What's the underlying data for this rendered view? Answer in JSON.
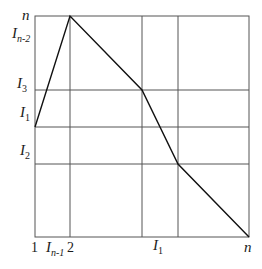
{
  "diagram": {
    "box": {
      "left": 35,
      "top": 16,
      "right": 249,
      "bottom": 237
    },
    "grid_color": "#555555",
    "line_color": "#111111",
    "vertical_lines_x": [
      70,
      142,
      178
    ],
    "horizontal_lines_y": [
      90,
      127,
      164
    ],
    "path_points": [
      [
        35,
        127
      ],
      [
        70,
        16
      ],
      [
        142,
        90
      ],
      [
        178,
        164
      ],
      [
        249,
        237
      ]
    ],
    "y_labels": [
      {
        "text": "n",
        "sub": "",
        "y": 16
      },
      {
        "text": "I",
        "sub": "n-2",
        "y": 33
      },
      {
        "text": "I",
        "sub": "3",
        "y": 84
      },
      {
        "text": "I",
        "sub": "1",
        "y": 113
      },
      {
        "text": "I",
        "sub": "2",
        "y": 151
      }
    ],
    "x_labels": [
      {
        "text": "1",
        "sub": "",
        "x": 35
      },
      {
        "text": "I",
        "sub": "n-1",
        "x": 52
      },
      {
        "text": "2",
        "sub": "",
        "x": 71
      },
      {
        "text": "I",
        "sub": "1",
        "x": 157
      },
      {
        "text": "n",
        "sub": "",
        "x": 248
      }
    ]
  }
}
